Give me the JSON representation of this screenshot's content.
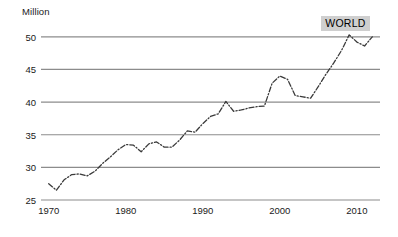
{
  "chart_data": {
    "type": "line",
    "title": "",
    "subtitle": "",
    "xlabel": "",
    "ylabel": "Million",
    "unit_label": "Million",
    "xlim": [
      1969,
      2013
    ],
    "ylim": [
      25,
      53.5
    ],
    "grid": true,
    "grid_axis": "y",
    "legend": "none",
    "line_style": "dash-dot",
    "line_color": "#3a3a3a",
    "grid_color": "#8c8c8c",
    "background": "#ffffff",
    "annotations": [
      {
        "text": "WORLD",
        "x": 2009,
        "y": 52.0,
        "background": "#cfcfcf",
        "color": "#000000"
      }
    ],
    "y_ticks": [
      25,
      30,
      35,
      40,
      45,
      50
    ],
    "y_tick_labels": [
      "25",
      "30",
      "35",
      "40",
      "45",
      "50"
    ],
    "x_ticks": [
      1970,
      1980,
      1990,
      2000,
      2010
    ],
    "x_tick_labels": [
      "1970",
      "1980",
      "1990",
      "2000",
      "2010"
    ],
    "series": [
      {
        "name": "WORLD",
        "x": [
          1970,
          1971,
          1972,
          1973,
          1974,
          1975,
          1976,
          1977,
          1978,
          1979,
          1980,
          1981,
          1982,
          1983,
          1984,
          1985,
          1986,
          1987,
          1988,
          1989,
          1990,
          1991,
          1992,
          1993,
          1994,
          1995,
          1996,
          1997,
          1998,
          1999,
          2000,
          2001,
          2002,
          2003,
          2004,
          2005,
          2006,
          2007,
          2008,
          2009,
          2010,
          2011,
          2012
        ],
        "values": [
          27.5,
          26.5,
          28.1,
          28.9,
          29.0,
          28.7,
          29.4,
          30.6,
          31.6,
          32.7,
          33.5,
          33.4,
          32.4,
          33.6,
          33.9,
          33.1,
          33.1,
          34.2,
          35.6,
          35.4,
          36.7,
          37.8,
          38.2,
          40.1,
          38.6,
          38.8,
          39.1,
          39.3,
          39.4,
          42.9,
          44.0,
          43.5,
          41.0,
          40.8,
          40.6,
          42.4,
          44.3,
          46.0,
          47.9,
          50.3,
          49.2,
          48.6,
          50.0
        ]
      }
    ]
  }
}
